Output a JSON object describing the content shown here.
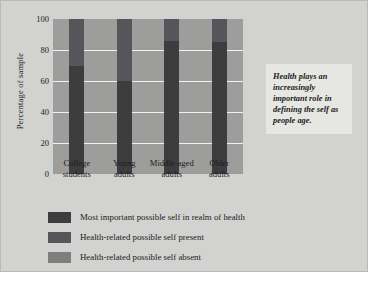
{
  "chart_data": {
    "type": "bar",
    "subtype": "stacked-bar",
    "title": "",
    "xlabel": "",
    "ylabel": "Percentage of sample",
    "ylim": [
      0,
      100
    ],
    "yticks": [
      0,
      20,
      40,
      60,
      80,
      100
    ],
    "grid": true,
    "legend_position": "below",
    "categories": [
      "College students",
      "Young adults",
      "Middle-aged adults",
      "Older adults"
    ],
    "category_lines": [
      [
        "College",
        "students"
      ],
      [
        "Young",
        "adults"
      ],
      [
        "Middle-aged",
        "adults"
      ],
      [
        "Older",
        "adults"
      ]
    ],
    "series": [
      {
        "name": "Most important possible self in realm of health",
        "color": "#3d3d40",
        "values": [
          70,
          60,
          86,
          85
        ]
      },
      {
        "name": "Health-related possible self present",
        "color": "#56565a",
        "values": [
          30,
          40,
          14,
          15
        ]
      },
      {
        "name": "Health-related possible self absent",
        "color": "#9d9d9b",
        "values": [
          0,
          0,
          0,
          0
        ]
      }
    ]
  },
  "legend": {
    "items": [
      {
        "label": "Most important possible self in realm of health",
        "color": "#3d3d40"
      },
      {
        "label": "Health-related possible self present",
        "color": "#56565a"
      },
      {
        "label": "Health-related possible self absent",
        "color": "#7e7e7c"
      }
    ]
  },
  "callout": {
    "text": "Health plays an increasingly important role in defining the self as people age."
  },
  "colors": {
    "figure_background": "#d2d2d0",
    "plot_background": "#9d9d9b",
    "gridline": "#f2f2ee",
    "callout_background": "#e6e6e2",
    "text": "#1b1b1b"
  }
}
